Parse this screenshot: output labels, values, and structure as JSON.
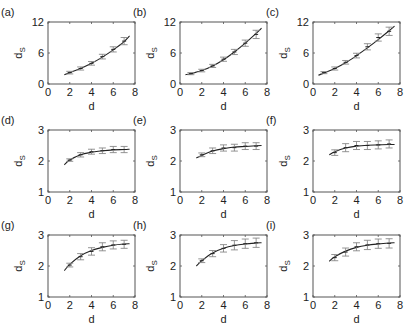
{
  "figure": {
    "panels_layout": {
      "rows": 3,
      "cols": 3
    },
    "line_color": "#222222",
    "errorbar_color": "#888888",
    "frame_color": "#555555"
  },
  "chart_data": [
    {
      "label": "(a)",
      "type": "line",
      "xlabel": "d",
      "ylabel": "d_S",
      "ylabel_main": "d",
      "ylabel_sub": "S",
      "xlim": [
        0,
        8
      ],
      "ylim": [
        0,
        12
      ],
      "xticks": [
        "0",
        "2",
        "4",
        "6",
        "8"
      ],
      "yticks": [
        "0",
        "6",
        "12"
      ],
      "x": [
        2,
        3,
        4,
        5,
        6,
        7
      ],
      "y": [
        2.2,
        3.0,
        4.0,
        5.3,
        6.7,
        8.3
      ],
      "err": [
        0.25,
        0.3,
        0.35,
        0.45,
        0.5,
        0.7
      ],
      "fit": {
        "x": [
          1.5,
          2,
          3,
          4,
          5,
          6,
          7,
          7.5
        ],
        "y": [
          1.8,
          2.2,
          3.0,
          4.0,
          5.2,
          6.6,
          8.2,
          9.3
        ]
      }
    },
    {
      "label": "(b)",
      "type": "line",
      "xlabel": "d",
      "ylabel": "d_S",
      "ylabel_main": "d",
      "ylabel_sub": "S",
      "xlim": [
        0,
        8
      ],
      "ylim": [
        0,
        12
      ],
      "xticks": [
        "0",
        "2",
        "4",
        "6",
        "8"
      ],
      "yticks": [
        "0",
        "6",
        "12"
      ],
      "x": [
        1,
        2,
        3,
        4,
        5,
        6,
        7
      ],
      "y": [
        2.0,
        2.6,
        3.5,
        4.8,
        6.2,
        7.9,
        9.6
      ],
      "err": [
        0.2,
        0.25,
        0.3,
        0.4,
        0.5,
        0.6,
        0.8
      ],
      "fit": {
        "x": [
          0.5,
          1,
          2,
          3,
          4,
          5,
          6,
          7,
          7.5
        ],
        "y": [
          1.8,
          2.0,
          2.6,
          3.5,
          4.7,
          6.2,
          7.9,
          9.8,
          10.8
        ]
      }
    },
    {
      "label": "(c)",
      "type": "line",
      "xlabel": "d",
      "ylabel": "d_S",
      "ylabel_main": "d",
      "ylabel_sub": "S",
      "xlim": [
        0,
        8
      ],
      "ylim": [
        0,
        12
      ],
      "xticks": [
        "0",
        "2",
        "4",
        "6",
        "8"
      ],
      "yticks": [
        "0",
        "6",
        "12"
      ],
      "x": [
        1,
        2,
        3,
        4,
        5,
        6,
        7
      ],
      "y": [
        2.2,
        3.0,
        4.2,
        5.5,
        7.2,
        9.0,
        10.2
      ],
      "err": [
        0.2,
        0.3,
        0.35,
        0.45,
        0.6,
        0.7,
        0.8
      ],
      "fit": {
        "x": [
          0.5,
          1,
          2,
          3,
          4,
          5,
          6,
          7,
          7.5
        ],
        "y": [
          1.7,
          2.1,
          3.0,
          4.1,
          5.5,
          7.0,
          8.6,
          10.3,
          11.2
        ]
      }
    },
    {
      "label": "(d)",
      "type": "line",
      "xlabel": "d",
      "ylabel": "d_S",
      "ylabel_main": "d",
      "ylabel_sub": "S",
      "xlim": [
        0,
        8
      ],
      "ylim": [
        1,
        3
      ],
      "xticks": [
        "0",
        "2",
        "4",
        "6",
        "8"
      ],
      "yticks": [
        "1",
        "2",
        "3"
      ],
      "x": [
        2,
        3,
        4,
        5,
        6,
        7
      ],
      "y": [
        2.03,
        2.2,
        2.3,
        2.33,
        2.37,
        2.37
      ],
      "err": [
        0.04,
        0.07,
        0.08,
        0.09,
        0.1,
        0.1
      ],
      "fit": {
        "x": [
          1.5,
          2,
          3,
          4,
          5,
          6,
          7,
          7.5
        ],
        "y": [
          1.88,
          2.03,
          2.2,
          2.28,
          2.33,
          2.36,
          2.37,
          2.38
        ]
      }
    },
    {
      "label": "(e)",
      "type": "line",
      "xlabel": "d",
      "ylabel": "d_S",
      "ylabel_main": "d",
      "ylabel_sub": "S",
      "xlim": [
        0,
        8
      ],
      "ylim": [
        1,
        3
      ],
      "xticks": [
        "0",
        "2",
        "4",
        "6",
        "8"
      ],
      "yticks": [
        "1",
        "2",
        "3"
      ],
      "x": [
        2,
        3,
        4,
        5,
        6,
        7
      ],
      "y": [
        2.2,
        2.33,
        2.42,
        2.43,
        2.48,
        2.48
      ],
      "err": [
        0.06,
        0.09,
        0.1,
        0.11,
        0.11,
        0.11
      ],
      "fit": {
        "x": [
          1.5,
          2,
          3,
          4,
          5,
          6,
          7,
          7.5
        ],
        "y": [
          2.1,
          2.18,
          2.32,
          2.4,
          2.45,
          2.47,
          2.49,
          2.5
        ]
      }
    },
    {
      "label": "(f)",
      "type": "line",
      "xlabel": "d",
      "ylabel": "d_S",
      "ylabel_main": "d",
      "ylabel_sub": "S",
      "xlim": [
        0,
        8
      ],
      "ylim": [
        1,
        3
      ],
      "xticks": [
        "0",
        "2",
        "4",
        "6",
        "8"
      ],
      "yticks": [
        "1",
        "2",
        "3"
      ],
      "x": [
        2,
        3,
        4,
        5,
        6,
        7
      ],
      "y": [
        2.27,
        2.43,
        2.5,
        2.5,
        2.52,
        2.55
      ],
      "err": [
        0.09,
        0.13,
        0.13,
        0.13,
        0.13,
        0.13
      ],
      "fit": {
        "x": [
          1.5,
          2,
          3,
          4,
          5,
          6,
          7,
          7.5
        ],
        "y": [
          2.2,
          2.3,
          2.42,
          2.48,
          2.51,
          2.52,
          2.53,
          2.53
        ]
      }
    },
    {
      "label": "(g)",
      "type": "line",
      "xlabel": "d",
      "ylabel": "d_S",
      "ylabel_main": "d",
      "ylabel_sub": "S",
      "xlim": [
        0,
        8
      ],
      "ylim": [
        1,
        3
      ],
      "xticks": [
        "0",
        "2",
        "4",
        "6",
        "8"
      ],
      "yticks": [
        "1",
        "2",
        "3"
      ],
      "x": [
        2,
        3,
        4,
        5,
        6,
        7
      ],
      "y": [
        2.03,
        2.3,
        2.47,
        2.62,
        2.68,
        2.7
      ],
      "err": [
        0.06,
        0.1,
        0.12,
        0.13,
        0.13,
        0.13
      ],
      "fit": {
        "x": [
          1.5,
          2,
          3,
          4,
          5,
          6,
          7,
          7.5
        ],
        "y": [
          1.85,
          2.05,
          2.33,
          2.5,
          2.6,
          2.67,
          2.71,
          2.72
        ]
      }
    },
    {
      "label": "(h)",
      "type": "line",
      "xlabel": "d",
      "ylabel": "d_S",
      "ylabel_main": "d",
      "ylabel_sub": "S",
      "xlim": [
        0,
        8
      ],
      "ylim": [
        1,
        3
      ],
      "xticks": [
        "0",
        "2",
        "4",
        "6",
        "8"
      ],
      "yticks": [
        "1",
        "2",
        "3"
      ],
      "x": [
        2,
        3,
        4,
        5,
        6,
        7
      ],
      "y": [
        2.17,
        2.4,
        2.57,
        2.67,
        2.72,
        2.75
      ],
      "err": [
        0.06,
        0.1,
        0.12,
        0.15,
        0.15,
        0.15
      ],
      "fit": {
        "x": [
          1.5,
          2,
          3,
          4,
          5,
          6,
          7,
          7.5
        ],
        "y": [
          2.0,
          2.17,
          2.42,
          2.57,
          2.66,
          2.71,
          2.74,
          2.75
        ]
      }
    },
    {
      "label": "(i)",
      "type": "line",
      "xlabel": "d",
      "ylabel": "d_S",
      "ylabel_main": "d",
      "ylabel_sub": "S",
      "xlim": [
        0,
        8
      ],
      "ylim": [
        1,
        3
      ],
      "xticks": [
        "0",
        "2",
        "4",
        "6",
        "8"
      ],
      "yticks": [
        "1",
        "2",
        "3"
      ],
      "x": [
        2,
        3,
        4,
        5,
        6,
        7
      ],
      "y": [
        2.27,
        2.45,
        2.62,
        2.68,
        2.72,
        2.73
      ],
      "err": [
        0.1,
        0.13,
        0.13,
        0.15,
        0.15,
        0.15
      ],
      "fit": {
        "x": [
          1.5,
          2,
          3,
          4,
          5,
          6,
          7,
          7.5
        ],
        "y": [
          2.15,
          2.3,
          2.48,
          2.6,
          2.67,
          2.71,
          2.74,
          2.75
        ]
      }
    }
  ]
}
